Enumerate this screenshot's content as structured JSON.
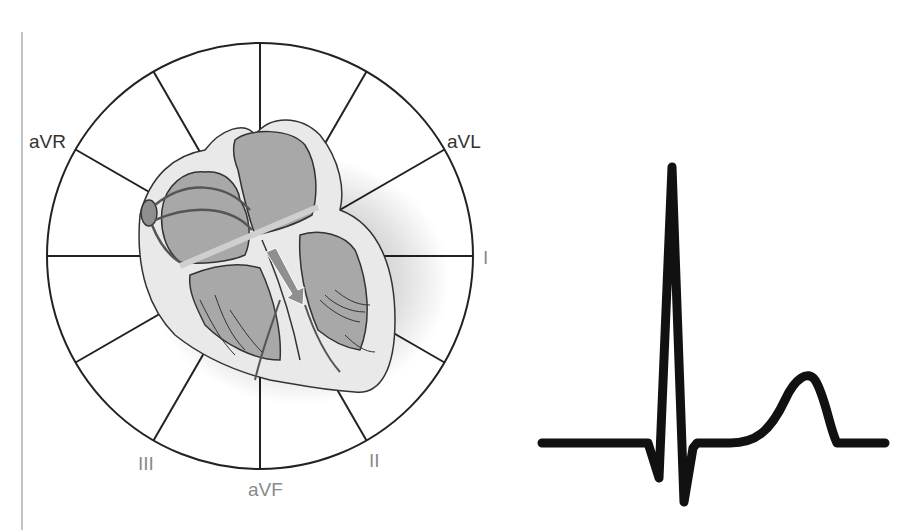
{
  "diagram": {
    "hexaxial": {
      "center": [
        260,
        256
      ],
      "radius": 213,
      "spoke_angles_deg": [
        0,
        30,
        60,
        90,
        120,
        150,
        180,
        210,
        240,
        270,
        300,
        330
      ],
      "labels": [
        {
          "id": "aVR",
          "text": "aVR",
          "tone": "dark"
        },
        {
          "id": "aVL",
          "text": "aVL",
          "tone": "dark"
        },
        {
          "id": "I",
          "text": "I",
          "tone": "gray"
        },
        {
          "id": "II",
          "text": "II",
          "tone": "gray"
        },
        {
          "id": "aVF",
          "text": "aVF",
          "tone": "gray"
        },
        {
          "id": "III",
          "text": "III",
          "tone": "gray"
        }
      ]
    },
    "heart": {
      "description": "Cross-section of heart showing conduction pathways and a mean electrical axis arrow",
      "fill_light": "#e9e9e9",
      "fill_chamber": "#a8a8a8",
      "arrow_color": "#8f8f8f"
    },
    "ecg": {
      "description": "Single ECG complex: Q wave, tall R wave, S wave, ST segment, T wave",
      "waves": [
        "P-less baseline",
        "Q",
        "R",
        "S",
        "ST",
        "T"
      ],
      "stroke_color": "#111111"
    },
    "colors": {
      "background": "#ffffff",
      "line": "#222222",
      "label_dark": "#333333",
      "label_gray": "#8a8a8a",
      "margin_line": "#b0b0b0"
    }
  }
}
